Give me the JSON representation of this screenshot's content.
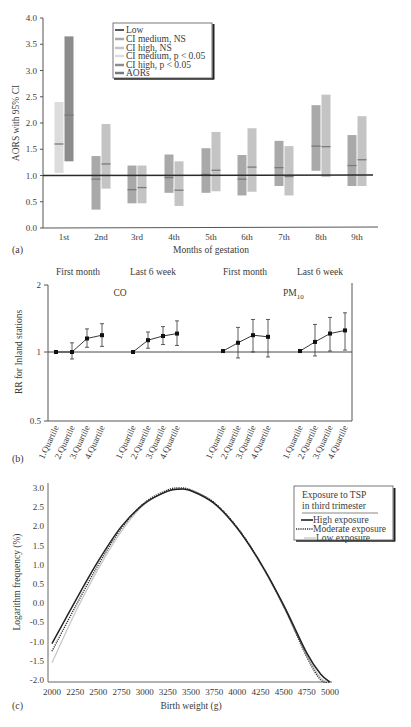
{
  "chart_data": [
    {
      "panel": "(a)",
      "type": "bar",
      "subtype": "floating-range (95% CI) with point estimate",
      "title": "",
      "xlabel": "Months of gestation",
      "ylabel": "AORS with 95% CI",
      "ylim": [
        0.0,
        4.0
      ],
      "yticks": [
        "0.0",
        "0.5",
        "1.0",
        "1.5",
        "2.0",
        "2.5",
        "3.0",
        "3.5",
        "4.0"
      ],
      "reference_line": {
        "label": "Low",
        "value": 1.0
      },
      "categories": [
        "1st",
        "2nd",
        "3rd",
        "4th",
        "5th",
        "6th",
        "7th",
        "8th",
        "9th"
      ],
      "legend": [
        "Low",
        "CI medium, NS",
        "CI high, NS",
        "CI medium, p < 0.05",
        "CI high, p < 0.05",
        "AORs"
      ],
      "legend_position": "upper-left inside",
      "series": [
        {
          "name": "Medium exposure",
          "ci_low": [
            1.05,
            0.35,
            0.47,
            0.67,
            0.67,
            0.62,
            0.8,
            1.09,
            0.8
          ],
          "ci_high": [
            2.4,
            1.37,
            1.19,
            1.4,
            1.52,
            1.39,
            1.66,
            2.34,
            1.77
          ],
          "aor": [
            1.6,
            0.93,
            0.73,
            0.96,
            1.02,
            0.93,
            1.15,
            1.56,
            1.19
          ],
          "significant": [
            true,
            false,
            false,
            false,
            false,
            false,
            false,
            false,
            false
          ]
        },
        {
          "name": "High exposure",
          "ci_low": [
            1.27,
            0.75,
            0.47,
            0.42,
            0.7,
            0.69,
            0.62,
            0.97,
            0.8
          ],
          "ci_high": [
            3.65,
            1.98,
            1.19,
            1.27,
            1.83,
            1.9,
            1.56,
            2.54,
            2.13
          ],
          "aor": [
            2.15,
            1.22,
            0.77,
            0.72,
            1.1,
            1.16,
            0.98,
            1.55,
            1.3
          ],
          "significant": [
            true,
            false,
            false,
            false,
            false,
            false,
            false,
            false,
            false
          ]
        }
      ],
      "colors": {
        "ci_medium_ns": "#a9a9a9",
        "ci_high_ns": "#c4c4c4",
        "ci_medium_sig": "#dcdcdc",
        "ci_high_sig": "#8c8c8c",
        "aor_mark": "#7a7a7a",
        "low_line": "#222222"
      }
    },
    {
      "panel": "(b)",
      "type": "line",
      "subtype": "point estimates with error bars, log y-axis",
      "ylabel": "RR for Inland stations",
      "ylim": [
        0.5,
        2
      ],
      "yscale": "log",
      "yticks": [
        "0.5",
        "1",
        "2"
      ],
      "group_headers": [
        "First month",
        "Last 6 week",
        "First month",
        "Last 6 week"
      ],
      "pollutant_labels": [
        "CO",
        "PM10"
      ],
      "categories": [
        "1.Quartile",
        "2.Quartile",
        "3.Quartile",
        "4.Quartile"
      ],
      "series": [
        {
          "name": "CO First month",
          "values": [
            1.0,
            1.0,
            1.15,
            1.19
          ],
          "lower": [
            1.0,
            0.93,
            1.05,
            1.06
          ],
          "upper": [
            1.0,
            1.1,
            1.27,
            1.34
          ]
        },
        {
          "name": "CO Last 6 week",
          "values": [
            1.0,
            1.13,
            1.18,
            1.21
          ],
          "lower": [
            1.0,
            1.04,
            1.08,
            1.07
          ],
          "upper": [
            1.0,
            1.23,
            1.3,
            1.38
          ]
        },
        {
          "name": "PM10 First month",
          "values": [
            1.01,
            1.1,
            1.19,
            1.17
          ],
          "lower": [
            1.01,
            0.94,
            1.0,
            0.95
          ],
          "upper": [
            1.01,
            1.29,
            1.4,
            1.4
          ]
        },
        {
          "name": "PM10 Last 6 week",
          "values": [
            1.01,
            1.11,
            1.21,
            1.25
          ],
          "lower": [
            1.01,
            0.96,
            1.01,
            1.02
          ],
          "upper": [
            1.01,
            1.33,
            1.43,
            1.5
          ]
        }
      ],
      "reference_line": 1
    },
    {
      "panel": "(c)",
      "type": "line",
      "xlabel": "Birth weight (g)",
      "ylabel": "Logarithm frequency (%)",
      "xlim": [
        2000,
        5000
      ],
      "ylim": [
        -2.0,
        3.0
      ],
      "xticks": [
        "2000",
        "2250",
        "2500",
        "2750",
        "3000",
        "3250",
        "3500",
        "3750",
        "4000",
        "4250",
        "4500",
        "4750",
        "5000"
      ],
      "yticks": [
        "-2.0",
        "-1.5",
        "-1.0",
        "-0.5",
        "0.0",
        "0.5",
        "1.0",
        "1.5",
        "2.0",
        "2.5",
        "3.0"
      ],
      "legend_title": [
        "Exposure to TSP",
        "in third trimester"
      ],
      "legend": [
        "High exposure",
        "Moderate exposure",
        "Low exposure"
      ],
      "legend_position": "upper-right",
      "x": [
        2000,
        2250,
        2500,
        2750,
        3000,
        3250,
        3375,
        3500,
        3750,
        4000,
        4250,
        4500,
        4750,
        4900,
        5000
      ],
      "series": [
        {
          "name": "High exposure",
          "style": "solid",
          "values": [
            -1.05,
            0.05,
            1.1,
            2.0,
            2.6,
            2.92,
            2.97,
            2.93,
            2.6,
            1.95,
            1.05,
            -0.05,
            -1.3,
            -1.85,
            -2.05
          ]
        },
        {
          "name": "Moderate exposure",
          "style": "dotted",
          "values": [
            -1.25,
            -0.1,
            1.0,
            1.95,
            2.62,
            2.95,
            3.0,
            2.95,
            2.62,
            1.97,
            1.05,
            -0.08,
            -1.4,
            -2.0,
            -2.05
          ]
        },
        {
          "name": "Low exposure",
          "style": "light",
          "values": [
            -1.55,
            -0.25,
            0.9,
            1.88,
            2.58,
            2.92,
            2.97,
            2.93,
            2.6,
            1.95,
            1.02,
            -0.1,
            -1.35,
            -1.95,
            -2.05
          ]
        }
      ]
    }
  ],
  "panel_a": {
    "label": "(a)",
    "xlabel": "Months of gestation",
    "ylabel": "AORS with 95% CI",
    "legend": {
      "low": "Low",
      "ci_medium_ns": "CI medium, NS",
      "ci_high_ns": "CI high, NS",
      "ci_medium_sig": "CI medium, p < 0.05",
      "ci_high_sig": "CI high, p < 0.05",
      "aors": "AORs"
    },
    "yticks": [
      "0.0",
      "0.5",
      "1.0",
      "1.5",
      "2.0",
      "2.5",
      "3.0",
      "3.5",
      "4.0"
    ],
    "months": [
      "1st",
      "2nd",
      "3rd",
      "4th",
      "5th",
      "6th",
      "7th",
      "8th",
      "9th"
    ]
  },
  "panel_b": {
    "label": "(b)",
    "ylabel": "RR for Inland stations",
    "headers": [
      "First month",
      "Last 6 week",
      "First month",
      "Last 6 week"
    ],
    "pollutant_co": "CO",
    "pollutant_pm": "PM",
    "pollutant_pm_sub": "10",
    "yticks": [
      "2",
      "1",
      "0.5"
    ],
    "quartiles": [
      "1.Quartile",
      "2.Quartile",
      "3.Quartile",
      "4.Quartile"
    ]
  },
  "panel_c": {
    "label": "(c)",
    "xlabel": "Birth weight (g)",
    "ylabel": "Logarithm frequency (%)",
    "legend_title_1": "Exposure to TSP",
    "legend_title_2": "in third trimester",
    "legend_high": "High exposure",
    "legend_moderate": "Moderate exposure",
    "legend_low": "Low exposure",
    "xticks": [
      "2000",
      "2250",
      "2500",
      "2750",
      "3000",
      "3250",
      "3500",
      "3750",
      "4000",
      "4250",
      "4500",
      "4750",
      "5000"
    ],
    "yticks": [
      "3.0",
      "2.5",
      "2.0",
      "1.5",
      "1.0",
      "0.5",
      "0.0",
      "-0.5",
      "-1.0",
      "-1.5",
      "-2.0"
    ]
  }
}
